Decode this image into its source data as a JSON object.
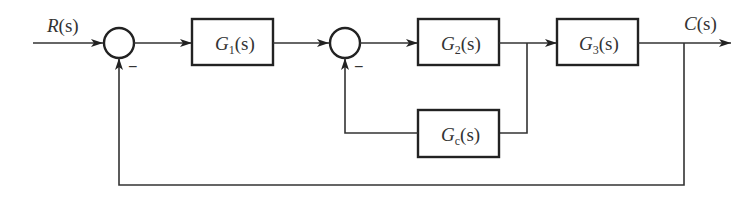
{
  "diagram": {
    "type": "control-system-block-diagram",
    "input": {
      "label": "R",
      "arg": "(s)"
    },
    "output": {
      "label": "C",
      "arg": "(s)"
    },
    "blocks": [
      {
        "id": "G1",
        "name": "G",
        "sub": "1",
        "arg": "(s)"
      },
      {
        "id": "G2",
        "name": "G",
        "sub": "2",
        "arg": "(s)"
      },
      {
        "id": "G3",
        "name": "G",
        "sub": "3",
        "arg": "(s)"
      },
      {
        "id": "Gc",
        "name": "G",
        "sub": "c",
        "arg": "(s)"
      }
    ],
    "summing_junctions": [
      {
        "id": "S1",
        "feedback_sign": "−"
      },
      {
        "id": "S2",
        "feedback_sign": "−"
      }
    ],
    "connections": [
      {
        "from": "R",
        "to": "S1"
      },
      {
        "from": "S1",
        "to": "G1"
      },
      {
        "from": "G1",
        "to": "S2"
      },
      {
        "from": "S2",
        "to": "G2"
      },
      {
        "from": "G2",
        "to": "G3"
      },
      {
        "from": "G2-output",
        "to": "Gc",
        "kind": "feedback"
      },
      {
        "from": "Gc",
        "to": "S2",
        "kind": "feedback",
        "sign": "−"
      },
      {
        "from": "G3",
        "to": "C"
      },
      {
        "from": "C",
        "to": "S1",
        "kind": "feedback",
        "sign": "−"
      }
    ]
  }
}
